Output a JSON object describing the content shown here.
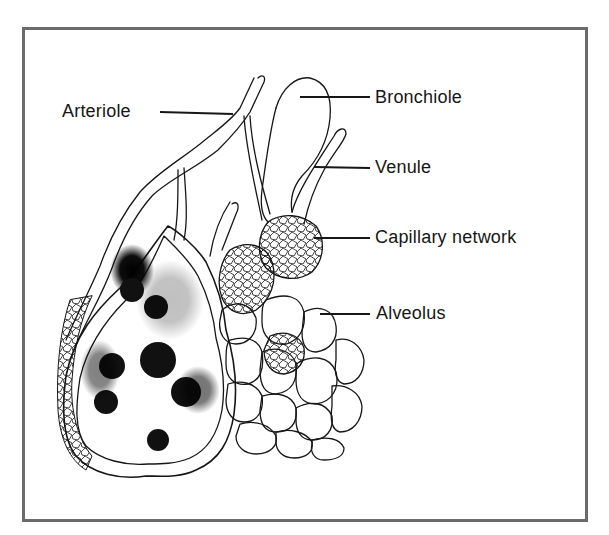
{
  "figure": {
    "type": "anatomical-illustration",
    "colors": {
      "frame": "#6b6b6b",
      "ink": "#161616",
      "background": "#ffffff"
    }
  },
  "labels": {
    "arteriole": "Arteriole",
    "bronchiole": "Bronchiole",
    "venule": "Venule",
    "capillary_network": "Capillary network",
    "alveolus": "Alveolus"
  }
}
